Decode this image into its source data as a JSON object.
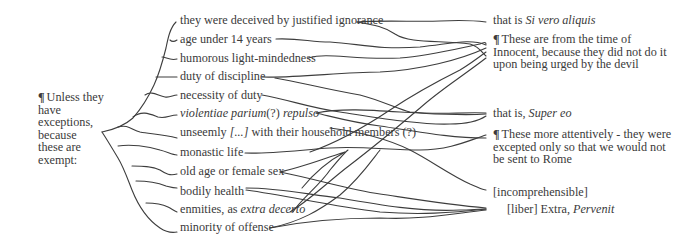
{
  "root": {
    "lines": [
      "Unless they have",
      "exceptions, because",
      "these are",
      "exempt:"
    ],
    "pilcrow": "¶"
  },
  "items": [
    {
      "pre": "they were deceived by justified ignorance",
      "it": "",
      "post": ""
    },
    {
      "pre": "age under 14 years",
      "it": "",
      "post": ""
    },
    {
      "pre": "humorous light-mindedness",
      "it": "",
      "post": ""
    },
    {
      "pre": "duty of discipline",
      "it": "",
      "post": ""
    },
    {
      "pre": "necessity of duty",
      "it": "",
      "post": ""
    },
    {
      "pre": "",
      "it": "violentiae parium",
      "post": "(?) ",
      "it2": "repulso"
    },
    {
      "pre": "unseemly ",
      "it": "[...]",
      "post": " with their household members (?)"
    },
    {
      "pre": "monastic life",
      "it": "",
      "post": ""
    },
    {
      "pre": "old age or female sex",
      "it": "",
      "post": ""
    },
    {
      "pre": "bodily health",
      "it": "",
      "post": ""
    },
    {
      "pre": "enmities, as ",
      "it": "extra decerto",
      "post": ""
    },
    {
      "pre": "minority of offense",
      "it": "",
      "post": ""
    }
  ],
  "targets": [
    {
      "pre": "that is ",
      "it": "Si vero aliquis"
    },
    {
      "pilcrow": "¶",
      "text": "These are from the time of Innocent, because they did not do it upon being urged by the devil"
    },
    {
      "pre": "that is, ",
      "it": "Super eo"
    },
    {
      "pilcrow": "¶",
      "text": "These more attentively - they were excepted only so that we would not be sent to Rome"
    },
    {
      "pre": "[incomprehensible]",
      "it": ""
    },
    {
      "pre": "[liber] Extra, ",
      "it": "Pervenit"
    }
  ],
  "colors": {
    "ink": "#3a3a3a",
    "background": "#ffffff"
  }
}
